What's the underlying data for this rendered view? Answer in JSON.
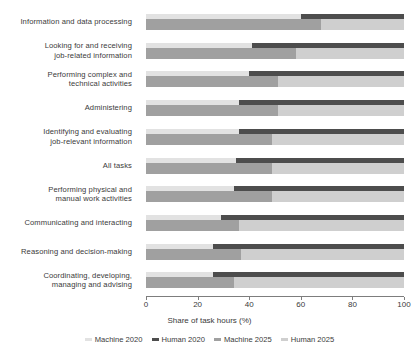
{
  "chart_data": {
    "type": "bar",
    "orientation": "horizontal",
    "stacked": true,
    "title": "",
    "xlabel": "Share of task hours (%)",
    "ylabel": "",
    "xlim": [
      0,
      100
    ],
    "xticks": [
      0,
      20,
      40,
      60,
      80,
      100
    ],
    "xtick_labels": [
      "0",
      "20",
      "40",
      "60",
      "80",
      "100"
    ],
    "grid": false,
    "legend_position": "bottom",
    "legend": [
      "Machine 2020",
      "Human 2020",
      "Machine 2025",
      "Human 2025"
    ],
    "colors": {
      "machine_2020": "#e2e2e2",
      "human_2020": "#4d4d4d",
      "machine_2025": "#a0a0a0",
      "human_2025": "#cfcfcf"
    },
    "categories": [
      "Information and data processing",
      "Looking for and receiving job-related information",
      "Performing complex and technical activities",
      "Administering",
      "Identifying and evaluating job-relevant information",
      "All tasks",
      "Performing physical and manual work activities",
      "Communicating and interacting",
      "Reasoning and decision-making",
      "Coordinating, developing, managing and advising"
    ],
    "series": [
      {
        "name": "Machine 2020",
        "values": [
          60,
          41,
          40,
          36,
          36,
          35,
          34,
          29,
          26,
          26
        ]
      },
      {
        "name": "Human 2020",
        "values": [
          40,
          59,
          60,
          64,
          64,
          65,
          66,
          71,
          74,
          74
        ]
      },
      {
        "name": "Machine 2025",
        "values": [
          68,
          58,
          51,
          51,
          49,
          49,
          49,
          36,
          37,
          34
        ]
      },
      {
        "name": "Human 2025",
        "values": [
          32,
          42,
          49,
          49,
          51,
          51,
          51,
          64,
          63,
          66
        ]
      }
    ]
  },
  "category_labels": [
    {
      "line1": "Information and data processing",
      "line2": ""
    },
    {
      "line1": "Looking for and receiving",
      "line2": "job-related information"
    },
    {
      "line1": "Performing complex and",
      "line2": "technical activities"
    },
    {
      "line1": "Administering",
      "line2": ""
    },
    {
      "line1": "Identifying and evaluating",
      "line2": "job-relevant information"
    },
    {
      "line1": "All tasks",
      "line2": ""
    },
    {
      "line1": "Performing physical and",
      "line2": "manual work activities"
    },
    {
      "line1": "Communicating and interacting",
      "line2": ""
    },
    {
      "line1": "Reasoning and decision-making",
      "line2": ""
    },
    {
      "line1": "Coordinating, developing,",
      "line2": "managing and advising"
    }
  ]
}
